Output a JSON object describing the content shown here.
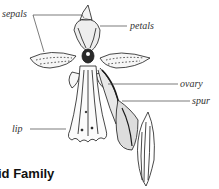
{
  "diagram": {
    "labels": {
      "sepals": "sepals",
      "petals": "petals",
      "ovary": "ovary",
      "spur": "spur",
      "lip": "lip"
    },
    "caption": "id Family"
  },
  "colors": {
    "line": "#333333",
    "ink": "#1a1a1a",
    "background": "#ffffff"
  }
}
